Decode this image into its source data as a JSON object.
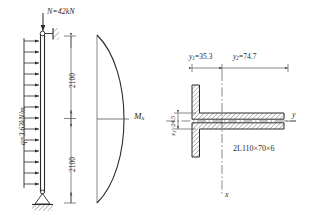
{
  "figure": {
    "type": "structural-engineering-diagram",
    "panels": [
      "beam-column-load-diagram",
      "bending-moment-diagram",
      "cross-section-diagram"
    ]
  },
  "left_panel": {
    "axial_load_label": "N=42kN",
    "distributed_load_label": "q=3.63kN/m",
    "dimension_upper": "2100",
    "dimension_lower": "2100",
    "top_support": "pinned-against-wall",
    "bottom_support": "pinned-hinge-on-ground"
  },
  "moment_panel": {
    "label": "M",
    "label_sub": "x",
    "shape": "parabolic"
  },
  "section_panel": {
    "dim_y1": "y",
    "dim_y1_sub": "1",
    "dim_y1_value": "=35.3",
    "dim_y2": "y",
    "dim_y2_sub": "2",
    "dim_y2_value": "=74.7",
    "dim_x1": "x",
    "dim_x1_sub": "1",
    "dim_x1_value": "=24.5",
    "axis_y": "y",
    "axis_x": "x",
    "section_designation": "2L110×70×6"
  },
  "colors": {
    "line": "#2b2b2b",
    "thin": "#555555",
    "hatch": "#3a3a3a",
    "background": "#ffffff"
  }
}
